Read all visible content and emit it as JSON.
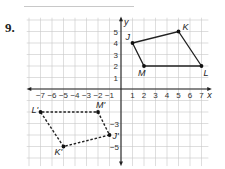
{
  "problem": {
    "number": "9.",
    "previous_problem_fragment": {
      "label": "A"
    }
  },
  "graph": {
    "x_axis_label": "x",
    "y_axis_label": "y",
    "x_ticks": [
      "-7",
      "-6",
      "-5",
      "-4",
      "-3",
      "-2",
      "-1",
      "1",
      "2",
      "3",
      "4",
      "5",
      "6",
      "7"
    ],
    "y_ticks_positive": [
      "1",
      "2",
      "3",
      "4",
      "5"
    ],
    "y_ticks_negative_shown": [
      "-3",
      "-5"
    ],
    "origin_px": [
      121,
      89
    ],
    "unit_px": 11.5,
    "grid_color": "#c8c8c8",
    "axis_color": "#222222"
  },
  "original_figure": {
    "style": "solid",
    "vertices": [
      {
        "name": "J",
        "x": 1,
        "y": 4
      },
      {
        "name": "K",
        "x": 5,
        "y": 5
      },
      {
        "name": "L",
        "x": 7,
        "y": 2
      },
      {
        "name": "M",
        "x": 2,
        "y": 2
      }
    ]
  },
  "image_figure": {
    "style": "dashed",
    "vertices": [
      {
        "name": "J'",
        "x": -1,
        "y": -4
      },
      {
        "name": "K'",
        "x": -5,
        "y": -5
      },
      {
        "name": "L'",
        "x": -7,
        "y": -2
      },
      {
        "name": "M'",
        "x": -2,
        "y": -2
      }
    ]
  }
}
